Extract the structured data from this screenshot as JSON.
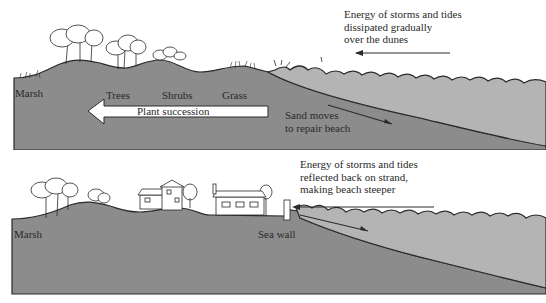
{
  "top_panel": {
    "labels": {
      "marsh": "Marsh",
      "trees": "Trees",
      "shrubs": "Shrubs",
      "grass": "Grass",
      "succession": "Plant succession",
      "sand_line1": "Sand moves",
      "sand_line2": "to repair beach"
    },
    "energy_note": [
      "Energy of storms and tides",
      "dissipated gradually",
      "over the dunes"
    ]
  },
  "bottom_panel": {
    "labels": {
      "marsh": "Marsh",
      "sea_wall": "Sea wall"
    },
    "energy_note": [
      "Energy of storms and tides",
      "reflected back on strand,",
      "making beach steeper"
    ]
  },
  "colors": {
    "land": "#8c8c8c",
    "water": "#b4b4b4",
    "outline": "#2a2a2a",
    "arrow_fill": "#ffffff"
  }
}
